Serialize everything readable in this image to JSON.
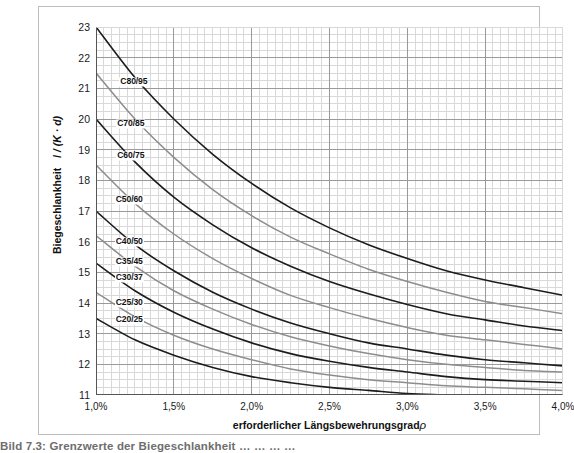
{
  "chart_data": {
    "type": "line",
    "title": "",
    "xlabel": "erforderlicher Längsbewehrungsgrad",
    "xlabel_symbol": "ρ",
    "ylabel_prefix": "Biegeschlankheit",
    "ylabel_symbol": "l / (K · d)",
    "xlim": [
      1.0,
      4.0
    ],
    "ylim": [
      11,
      23
    ],
    "grid": true,
    "legend": "inline-curve-labels",
    "x_tick_labels": [
      "1,0%",
      "1,5%",
      "2,0%",
      "2,5%",
      "3,0%",
      "3,5%",
      "4,0%"
    ],
    "x_tick_values": [
      1.0,
      1.5,
      2.0,
      2.5,
      3.0,
      3.5,
      4.0
    ],
    "y_tick_labels": [
      "11",
      "12",
      "13",
      "14",
      "15",
      "16",
      "17",
      "18",
      "19",
      "20",
      "21",
      "22",
      "23"
    ],
    "y_tick_values": [
      11,
      12,
      13,
      14,
      15,
      16,
      17,
      18,
      19,
      20,
      21,
      22,
      23
    ],
    "x_minor_step": 0.05,
    "y_minor_step": 0.25,
    "colors": {
      "dark_curve": "#1c1c1c",
      "gray_curve": "#8d8d8d",
      "major_grid": "#9a9a9a",
      "minor_grid": "#d9d9d9",
      "axis": "#555555"
    },
    "x": [
      1.0,
      1.25,
      1.5,
      1.75,
      2.0,
      2.25,
      2.5,
      2.75,
      3.0,
      3.25,
      3.5,
      3.75,
      4.0
    ],
    "series": [
      {
        "name": "C80/95",
        "label": "C80/95",
        "color": "#1c1c1c",
        "values": [
          23.0,
          21.35,
          20.0,
          18.85,
          17.9,
          17.1,
          16.45,
          15.9,
          15.45,
          15.05,
          14.75,
          14.5,
          14.25
        ]
      },
      {
        "name": "C70/85",
        "label": "C70/85",
        "color": "#8d8d8d",
        "values": [
          21.5,
          20.0,
          18.75,
          17.7,
          16.85,
          16.15,
          15.6,
          15.1,
          14.7,
          14.35,
          14.05,
          13.85,
          13.65
        ]
      },
      {
        "name": "C60/75",
        "label": "C60/75",
        "color": "#1c1c1c",
        "values": [
          20.0,
          18.6,
          17.45,
          16.55,
          15.8,
          15.2,
          14.7,
          14.3,
          13.95,
          13.65,
          13.45,
          13.25,
          13.1
        ]
      },
      {
        "name": "C50/60",
        "label": "C50/60",
        "color": "#8d8d8d",
        "values": [
          18.5,
          17.25,
          16.25,
          15.45,
          14.8,
          14.25,
          13.85,
          13.5,
          13.2,
          12.95,
          12.8,
          12.65,
          12.5
        ]
      },
      {
        "name": "C40/50",
        "label": "C40/50",
        "color": "#1c1c1c",
        "values": [
          17.0,
          15.9,
          15.05,
          14.35,
          13.8,
          13.35,
          13.0,
          12.7,
          12.5,
          12.3,
          12.15,
          12.05,
          11.95
        ]
      },
      {
        "name": "C35/45",
        "label": "C35/45",
        "color": "#8d8d8d",
        "values": [
          16.2,
          15.2,
          14.4,
          13.8,
          13.3,
          12.9,
          12.6,
          12.35,
          12.15,
          12.0,
          11.9,
          11.8,
          11.75
        ]
      },
      {
        "name": "C30/37",
        "label": "C30/37",
        "color": "#1c1c1c",
        "values": [
          15.3,
          14.4,
          13.7,
          13.15,
          12.7,
          12.35,
          12.1,
          11.9,
          11.75,
          11.6,
          11.5,
          11.45,
          11.4
        ]
      },
      {
        "name": "C25/30",
        "label": "C25/30",
        "color": "#8d8d8d",
        "values": [
          14.35,
          13.55,
          12.95,
          12.5,
          12.15,
          11.85,
          11.65,
          11.5,
          11.4,
          11.3,
          11.25,
          11.2,
          11.15
        ]
      },
      {
        "name": "C20/25",
        "label": "C20/25",
        "color": "#1c1c1c",
        "values": [
          13.5,
          12.8,
          12.3,
          11.9,
          11.6,
          11.4,
          11.25,
          11.15,
          11.05,
          11.0,
          10.95,
          10.9,
          10.9
        ]
      }
    ],
    "curve_label_positions": [
      {
        "name": "C80/95",
        "x": 1.15,
        "y": 21.2
      },
      {
        "name": "C70/85",
        "x": 1.13,
        "y": 19.85
      },
      {
        "name": "C60/75",
        "x": 1.13,
        "y": 18.8
      },
      {
        "name": "C50/60",
        "x": 1.12,
        "y": 17.35
      },
      {
        "name": "C40/50",
        "x": 1.12,
        "y": 16.0
      },
      {
        "name": "C35/45",
        "x": 1.12,
        "y": 15.35
      },
      {
        "name": "C30/37",
        "x": 1.12,
        "y": 14.8
      },
      {
        "name": "C25/30",
        "x": 1.12,
        "y": 14.0
      },
      {
        "name": "C20/25",
        "x": 1.12,
        "y": 13.45
      }
    ]
  },
  "caption": {
    "text": "Bild 7.3:   Grenzwerte der Biegeschlankheit …  …  …  …"
  }
}
